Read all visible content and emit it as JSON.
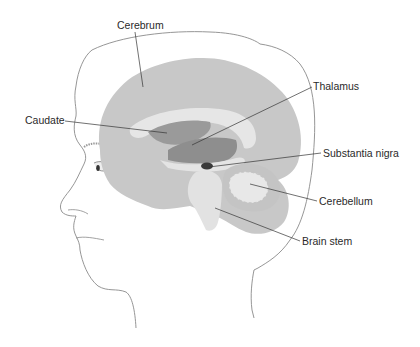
{
  "diagram": {
    "colors": {
      "background": "#ffffff",
      "outline": "#8a8a8a",
      "cerebrum": "#c8c8c8",
      "white_matter": "#e4e4e4",
      "caudate": "#9a9a9a",
      "thalamus": "#8e8e8e",
      "substantia_nigra": "#3a3a3a",
      "cerebellum": "#c4c4c4",
      "brain_stem": "#e2e2e2",
      "leader_line": "#333333",
      "label_text": "#2a2a2a"
    },
    "labels": [
      {
        "id": "cerebrum",
        "text": "Cerebrum",
        "x": 117,
        "y": 20
      },
      {
        "id": "caudate",
        "text": "Caudate",
        "x": 25,
        "y": 115
      },
      {
        "id": "thalamus",
        "text": "Thalamus",
        "x": 313,
        "y": 81
      },
      {
        "id": "substantia-nigra",
        "text": "Substantia nigra",
        "x": 323,
        "y": 148
      },
      {
        "id": "cerebellum",
        "text": "Cerebellum",
        "x": 319,
        "y": 196
      },
      {
        "id": "brain-stem",
        "text": "Brain stem",
        "x": 302,
        "y": 236
      }
    ]
  }
}
